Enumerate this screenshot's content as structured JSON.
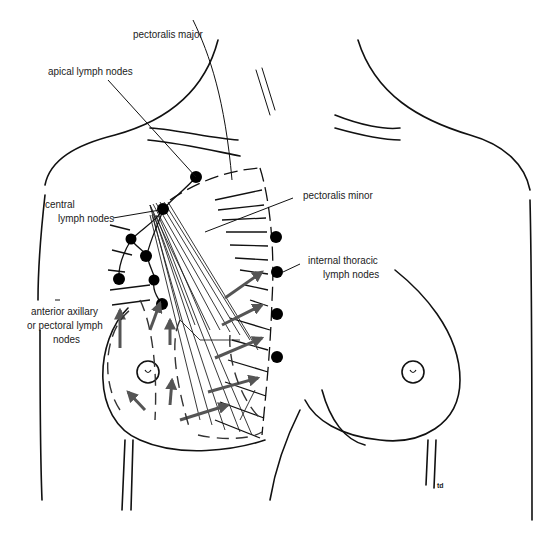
{
  "diagram": {
    "colors": {
      "line": "#111111",
      "arrow": "#555555",
      "node": "#000000",
      "background": "#ffffff"
    },
    "labels": {
      "pectoralis_major": "pectoralis major",
      "apical_lymph_nodes": "apical lymph nodes",
      "central_line1": "central",
      "central_line2": "lymph nodes",
      "pectoralis_minor": "pectoralis minor",
      "internal_thoracic_line1": "internal thoracic",
      "internal_thoracic_line2": "lymph nodes",
      "anterior_line1": "anterior axillary",
      "anterior_line2": "or pectoral lymph",
      "anterior_line3": "nodes"
    },
    "signature": "td"
  }
}
